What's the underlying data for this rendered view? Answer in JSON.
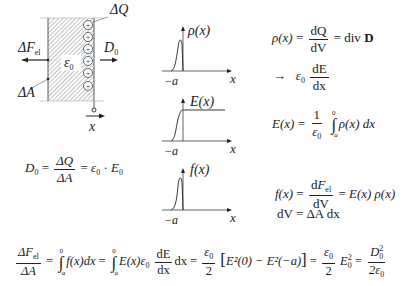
{
  "diagram": {
    "labels": {
      "delta_q": "ΔQ",
      "delta_f_el": "ΔF",
      "delta_f_el_sub": "el",
      "epsilon0": "ε",
      "epsilon0_sub": "0",
      "d0": "D",
      "d0_sub": "0",
      "delta_a": "ΔA",
      "x_axis": "x"
    },
    "charge_count": 6,
    "charge_symbol": "+"
  },
  "plots": [
    {
      "id": "rho",
      "label": "ρ(x)",
      "x_label": "x",
      "tick_label": "−a",
      "shape": "peak"
    },
    {
      "id": "E",
      "label": "E(x)",
      "x_label": "x",
      "tick_label": "−a",
      "shape": "step"
    },
    {
      "id": "f",
      "label": "f(x)",
      "x_label": "x",
      "tick_label": "−a",
      "shape": "peak"
    }
  ],
  "equations": {
    "d0_eq": {
      "lhs": "D",
      "lhs_sub": "0",
      "num": "ΔQ",
      "den": "ΔA",
      "rhs": "ε",
      "rhs_sub": "0",
      "dot": "·",
      "e": "E",
      "e_sub": "0"
    },
    "rho_eq": {
      "lhs": "ρ(x)",
      "num": "dQ",
      "den": "dV",
      "rhs": "div",
      "rhs_bold": "D",
      "arrow": "→",
      "eps": "ε",
      "eps_sub": "0",
      "num2": "dE",
      "den2": "dx"
    },
    "e_eq": {
      "lhs": "E(x)",
      "num": "1",
      "den": "ε",
      "den_sub": "0",
      "upper": "0",
      "lower": "−a",
      "integrand": "ρ(x) dx"
    },
    "f_eq": {
      "lhs": "f(x)",
      "num": "dF",
      "num_sub": "el",
      "den": "dV",
      "rhs": "E(x) ρ(x)"
    },
    "dv_eq": {
      "text": "dV = ΔA dx"
    },
    "bottom": {
      "lhs_num": "ΔF",
      "lhs_num_sub": "el",
      "lhs_den": "ΔA",
      "int1_upper": "0",
      "int1_lower": "−a",
      "int1_body": "f(x)dx",
      "int2_upper": "0",
      "int2_lower": "−a",
      "int2_body": "E(x)ε",
      "int2_sub": "0",
      "dE": "dE",
      "dx": "dx",
      "tail": "dx",
      "half_num": "ε",
      "half_num_sub": "0",
      "half_den": "2",
      "bracket": "E²(0) − E²(−a)",
      "half2_num": "ε",
      "half2_num_sub": "0",
      "half2_den": "2",
      "e0sq": "E",
      "e0sq_sub": "0",
      "e0sq_sup": "2",
      "last_num": "D",
      "last_num_sub": "0",
      "last_num_sup": "2",
      "last_den": "2ε",
      "last_den_sub": "0"
    }
  }
}
